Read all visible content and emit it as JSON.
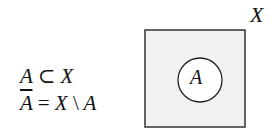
{
  "formulas": {
    "subset": {
      "lhs": "A",
      "op": "⊂",
      "rhs": "X"
    },
    "complement": {
      "lhs": "A",
      "eq": "=",
      "a": "X",
      "op": "\\",
      "b": "A"
    }
  },
  "diagram": {
    "universe_label": "X",
    "set_label": "A",
    "universe_fill": "#f2f2f2",
    "set_fill": "#ffffff"
  }
}
